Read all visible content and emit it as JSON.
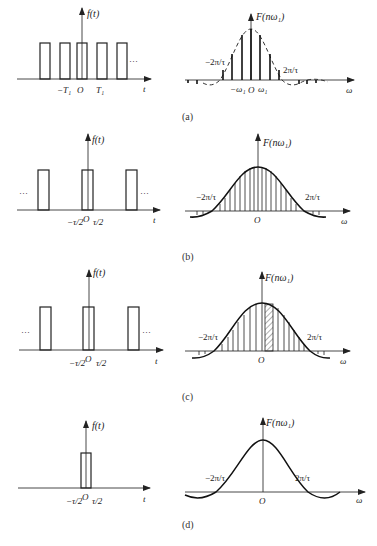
{
  "figure": {
    "panels": [
      {
        "id": "a",
        "caption": "(a)",
        "time_plot": {
          "y_label": "f(t)",
          "x_label": "t",
          "tick_labels": [
            "−T₁",
            "O",
            "T₁"
          ],
          "ellipsis": "…",
          "description": "Periodic rectangular pulse train with period T1"
        },
        "spectrum_plot": {
          "y_label": "F(nω₁)",
          "x_label": "ω",
          "tick_labels": [
            "−ω₁",
            "O",
            "ω₁"
          ],
          "zero_crossings": [
            "−2π/τ",
            "2π/τ"
          ],
          "envelope": "dashed",
          "description": "Discrete line spectrum under dashed sinc envelope, wide line spacing"
        }
      },
      {
        "id": "b",
        "caption": "(b)",
        "time_plot": {
          "y_label": "f(t)",
          "x_label": "t",
          "tick_labels": [
            "−τ/2",
            "O",
            "τ/2"
          ],
          "ellipsis": "…",
          "description": "Pulse train with larger period"
        },
        "spectrum_plot": {
          "y_label": "F(nω₁)",
          "x_label": "ω",
          "tick_labels": [
            "O"
          ],
          "zero_crossings": [
            "−2π/τ",
            "2π/τ"
          ],
          "envelope": "solid",
          "description": "Denser spectral lines under solid sinc envelope"
        }
      },
      {
        "id": "c",
        "caption": "(c)",
        "time_plot": {
          "y_label": "f(t)",
          "x_label": "t",
          "tick_labels": [
            "−τ/2",
            "O",
            "τ/2"
          ],
          "ellipsis": "…",
          "description": "Pulse train with large period"
        },
        "spectrum_plot": {
          "y_label": "F(nω₁)",
          "x_label": "ω",
          "tick_labels": [
            "O"
          ],
          "zero_crossings": [
            "−2π/τ",
            "2π/τ"
          ],
          "envelope": "solid",
          "highlight": "hatched strip right of origin",
          "description": "Dense spectral lines with one hatched strip"
        }
      },
      {
        "id": "d",
        "caption": "(d)",
        "time_plot": {
          "y_label": "f(t)",
          "x_label": "t",
          "tick_labels": [
            "−τ/2",
            "O",
            "τ/2"
          ],
          "description": "Single rectangular pulse (non-periodic)"
        },
        "spectrum_plot": {
          "y_label": "F(nω₁)",
          "x_label": "ω",
          "tick_labels": [
            "O"
          ],
          "zero_crossings": [
            "−2π/τ",
            "2π/τ"
          ],
          "envelope": "solid",
          "description": "Continuous sinc spectrum"
        }
      }
    ]
  }
}
